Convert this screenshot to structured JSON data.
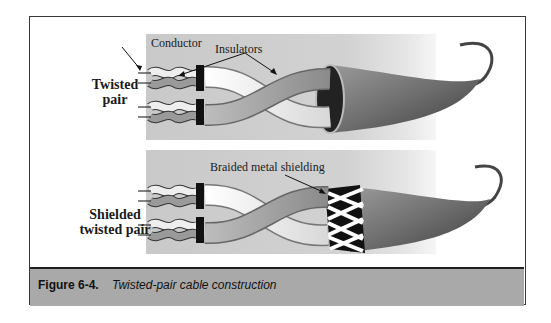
{
  "figure": {
    "rows": [
      {
        "label_line1": "Twisted",
        "label_line2": "pair"
      },
      {
        "label_line1": "Shielded",
        "label_line2": "twisted pair"
      }
    ],
    "callouts": {
      "conductor": "Conductor",
      "insulators": "Insulators",
      "shielding": "Braided metal shielding"
    },
    "caption": {
      "number": "Figure 6-4.",
      "title": "Twisted-pair cable construction"
    },
    "colors": {
      "panel_bg": "#cecece",
      "caption_bg": "#a9a9a9",
      "jacket_dark": "#5a5a5a",
      "frame": "#3a3a3a"
    }
  }
}
